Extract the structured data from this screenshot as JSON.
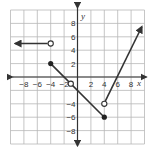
{
  "chart_data": {
    "type": "line",
    "title": "",
    "xlabel": "x",
    "ylabel": "y",
    "xlim": [
      -10,
      10
    ],
    "ylim": [
      -10,
      10
    ],
    "grid": true,
    "grid_step": 2,
    "x_ticks": [
      "-8",
      "-6",
      "-4",
      "-2",
      "2",
      "4",
      "6",
      "8"
    ],
    "y_ticks": [
      "8",
      "6",
      "4",
      "2",
      "-4",
      "-6",
      "-8"
    ],
    "series": [
      {
        "name": "piece-1",
        "description": "horizontal ray y=5 for x<-4",
        "points": [
          [
            -4,
            5
          ],
          [
            -10,
            5
          ]
        ],
        "start_closed": false,
        "arrow_end": true
      },
      {
        "name": "piece-2",
        "description": "segment from (-4,2) to (4,-6)",
        "points": [
          [
            -4,
            2
          ],
          [
            4,
            -6
          ]
        ],
        "start_closed": true,
        "end_closed": true
      },
      {
        "name": "piece-3",
        "description": "ray from (4,-4) upward slope 3",
        "points": [
          [
            4,
            -4
          ],
          [
            9.6,
            7.5
          ]
        ],
        "start_closed": false,
        "arrow_end": true
      }
    ],
    "open_points": [
      [
        -4,
        5
      ],
      [
        4,
        -4
      ],
      [
        -1,
        -1
      ]
    ],
    "closed_points": [
      [
        -4,
        2
      ],
      [
        4,
        -6
      ]
    ]
  },
  "labels": {
    "x_axis": "x",
    "y_axis": "y",
    "x_ticks": [
      "−8",
      "−6",
      "−4",
      "−2",
      "2",
      "4",
      "6",
      "8"
    ],
    "y_ticks": [
      "8",
      "6",
      "4",
      "2",
      "−4",
      "−6",
      "−8"
    ]
  }
}
